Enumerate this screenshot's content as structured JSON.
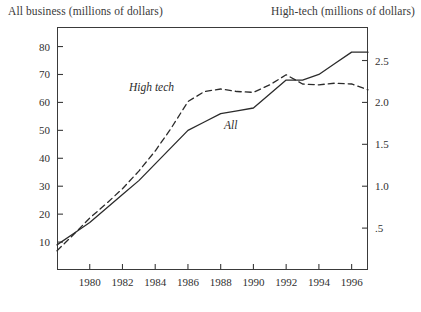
{
  "titles": {
    "left_axis": "All business (millions of dollars)",
    "right_axis": "High-tech (millions of dollars)"
  },
  "series_labels": {
    "high_tech": "High tech",
    "all": "All"
  },
  "chart_data": {
    "type": "line",
    "title": "",
    "xlabel": "",
    "ylabel": "All business (millions of dollars)",
    "y2label": "High-tech (millions of dollars)",
    "grid": false,
    "legend": "inline-annotations",
    "xlim": [
      1978,
      1997
    ],
    "ylim": [
      0,
      87
    ],
    "y2lim": [
      0,
      2.9
    ],
    "xticks": [
      1980,
      1982,
      1984,
      1986,
      1988,
      1990,
      1992,
      1994,
      1996
    ],
    "xtick_labels": [
      "1980",
      "1982",
      "1984",
      "1986",
      "1988",
      "1990",
      "1992",
      "1994",
      "1996"
    ],
    "yticks": [
      10,
      20,
      30,
      40,
      50,
      60,
      70,
      80
    ],
    "ytick_labels": [
      "10",
      "20",
      "30",
      "40",
      "50",
      "60",
      "70",
      "80"
    ],
    "y2ticks": [
      0.5,
      1.0,
      1.5,
      2.0,
      2.5
    ],
    "y2tick_labels": [
      ".5",
      "1.0",
      "1.5",
      "2.0",
      "2.5"
    ],
    "x": [
      1978,
      1979,
      1980,
      1981,
      1982,
      1983,
      1984,
      1985,
      1986,
      1987,
      1988,
      1989,
      1990,
      1991,
      1992,
      1993,
      1994,
      1995,
      1996,
      1997
    ],
    "series": [
      {
        "name": "All",
        "axis": "left",
        "style": "solid",
        "color": "#2b2b2b",
        "values": [
          9,
          13,
          17,
          22,
          27,
          32,
          38,
          44,
          50,
          53,
          56,
          57,
          58,
          63,
          68,
          68,
          70,
          74,
          78,
          78
        ]
      },
      {
        "name": "High tech",
        "axis": "right",
        "style": "dashed",
        "color": "#2b2b2b",
        "values": [
          0.23,
          0.42,
          0.62,
          0.79,
          0.97,
          1.18,
          1.42,
          1.7,
          2.01,
          2.13,
          2.16,
          2.13,
          2.12,
          2.21,
          2.33,
          2.22,
          2.21,
          2.23,
          2.22,
          2.15
        ]
      }
    ]
  }
}
